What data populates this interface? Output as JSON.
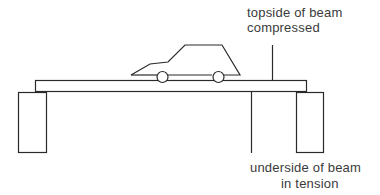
{
  "diagram": {
    "labels": {
      "top_line1": "topside of beam",
      "top_line2": "compressed",
      "bottom_line1": "underside of beam",
      "bottom_line2": "in tension"
    },
    "elements": [
      "beam",
      "left-support",
      "right-support",
      "car",
      "topside-leader-line",
      "underside-leader-line"
    ],
    "colors": {
      "stroke": "#2a2a2a",
      "text": "#3a3a3a",
      "background": "#ffffff"
    }
  }
}
